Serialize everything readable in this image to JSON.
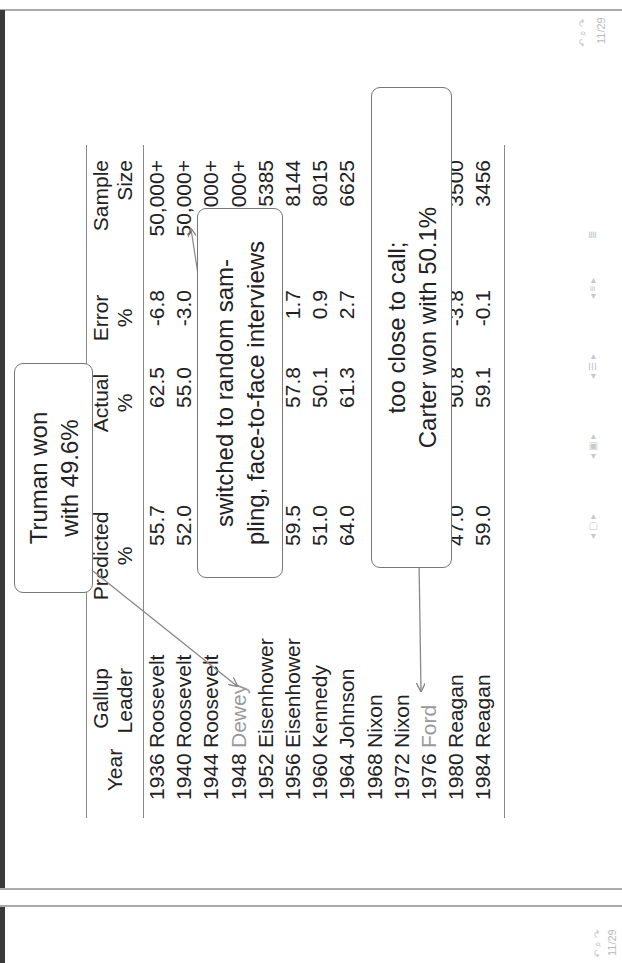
{
  "slide": {
    "page_indicator": "11/29",
    "table": {
      "headers": {
        "year": "Year",
        "leader": [
          "Gallup",
          "Leader"
        ],
        "predicted": [
          "Predicted",
          "%"
        ],
        "actual": [
          "Actual",
          "%"
        ],
        "error": [
          "Error",
          "%"
        ],
        "sample": [
          "Sample",
          "Size"
        ]
      },
      "rows": [
        {
          "year": "1936",
          "leader": "Roosevelt",
          "predicted": "55.7",
          "actual": "62.5",
          "error": "-6.8",
          "sample": "50,000+"
        },
        {
          "year": "1940",
          "leader": "Roosevelt",
          "predicted": "52.0",
          "actual": "55.0",
          "error": "-3.0",
          "sample": "50,000+"
        },
        {
          "year": "1944",
          "leader": "Roosevelt",
          "predicted": "",
          "actual": "",
          "error": "",
          "sample": "50,000+"
        },
        {
          "year": "1948",
          "leader": "Dewey",
          "predicted": "",
          "actual": "",
          "error": "",
          "sample": "50,000+",
          "highlight": true
        },
        {
          "year": "1952",
          "leader": "Eisenhower",
          "predicted": "",
          "actual": "",
          "error": "",
          "sample": "5385"
        },
        {
          "year": "1956",
          "leader": "Eisenhower",
          "predicted": "59.5",
          "actual": "57.8",
          "error": "1.7",
          "sample": "8144"
        },
        {
          "year": "1960",
          "leader": "Kennedy",
          "predicted": "51.0",
          "actual": "50.1",
          "error": "0.9",
          "sample": "8015"
        },
        {
          "year": "1964",
          "leader": "Johnson",
          "predicted": "64.0",
          "actual": "61.3",
          "error": "2.7",
          "sample": "6625"
        },
        {
          "year": "1968",
          "leader": "Nixon",
          "predicted": "",
          "actual": "",
          "error": "",
          "sample": ""
        },
        {
          "year": "1972",
          "leader": "Nixon",
          "predicted": "",
          "actual": "",
          "error": "",
          "sample": ""
        },
        {
          "year": "1976",
          "leader": "Ford",
          "predicted": "",
          "actual": "",
          "error": "",
          "sample": "",
          "highlight": true
        },
        {
          "year": "1980",
          "leader": "Reagan",
          "predicted": "47.0",
          "actual": "50.8",
          "error": "-3.8",
          "sample": "3500"
        },
        {
          "year": "1984",
          "leader": "Reagan",
          "predicted": "59.0",
          "actual": "59.1",
          "error": "-0.1",
          "sample": "3456"
        }
      ]
    },
    "callouts": {
      "truman": [
        "Truman won",
        "with 49.6%"
      ],
      "sampling": [
        "switched to random sam-",
        "pling, face-to-face interviews"
      ],
      "carter": [
        "too close to call;",
        "Carter won with 50.1%"
      ]
    },
    "colors": {
      "text": "#222222",
      "highlight_grey": "#9a9a9a",
      "rule": "#888888",
      "callout_border": "#777777",
      "arrow": "#888888"
    }
  },
  "next_slide": {
    "page_indicator": "11/29"
  }
}
